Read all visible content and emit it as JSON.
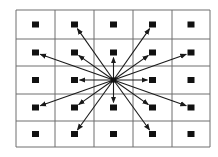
{
  "diagram": {
    "type": "grid-neighborhood",
    "grid": {
      "cols": 5,
      "rows": 5,
      "col_lines": [
        16,
        55,
        94,
        133,
        172,
        210
      ],
      "row_lines": [
        10,
        39,
        66,
        94,
        121,
        147
      ],
      "line_color": "#6e6e6e"
    },
    "node": {
      "size": 7,
      "color": "#111111"
    },
    "center": {
      "col": 2,
      "row": 2
    },
    "arrow_color": "#1a1a1a",
    "arrow_targets": [
      {
        "col": 1,
        "row": 0
      },
      {
        "col": 3,
        "row": 0
      },
      {
        "col": 0,
        "row": 1
      },
      {
        "col": 1,
        "row": 1
      },
      {
        "col": 2,
        "row": 1
      },
      {
        "col": 3,
        "row": 1
      },
      {
        "col": 4,
        "row": 1
      },
      {
        "col": 1,
        "row": 2
      },
      {
        "col": 3,
        "row": 2
      },
      {
        "col": 0,
        "row": 3
      },
      {
        "col": 1,
        "row": 3
      },
      {
        "col": 2,
        "row": 3
      },
      {
        "col": 3,
        "row": 3
      },
      {
        "col": 4,
        "row": 3
      },
      {
        "col": 1,
        "row": 4
      },
      {
        "col": 3,
        "row": 4
      }
    ]
  }
}
